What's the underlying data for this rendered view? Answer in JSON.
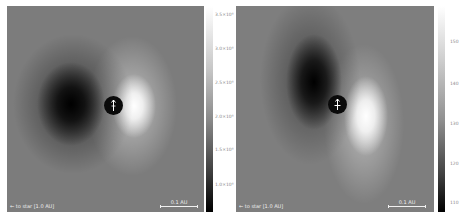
{
  "panels": [
    {
      "id": "left",
      "star_label": "← to star [1.0 AU]",
      "scale_label": "0.1 AU",
      "planet_symbol": "arrow-up-icon"
    },
    {
      "id": "right",
      "star_label": "← to star [1.0 AU]",
      "scale_label": "0.1 AU",
      "planet_symbol": "arrow-cross-icon"
    }
  ],
  "colorbars": {
    "left": {
      "ticks": [
        "3.5×10⁸",
        "3.0×10⁸",
        "2.5×10⁸",
        "2.0×10⁸",
        "1.5×10⁸",
        "1.0×10⁸"
      ],
      "tick_y": [
        15,
        49,
        83,
        117,
        150,
        185
      ]
    },
    "right": {
      "ticks": [
        "150",
        "140",
        "130",
        "120",
        "110"
      ],
      "tick_y": [
        42,
        84,
        124,
        164,
        203
      ]
    }
  },
  "colors": {
    "background_field": "#7c7c7c",
    "annotation": "#f0f0f0",
    "tick_text": "#8a8a8a"
  }
}
